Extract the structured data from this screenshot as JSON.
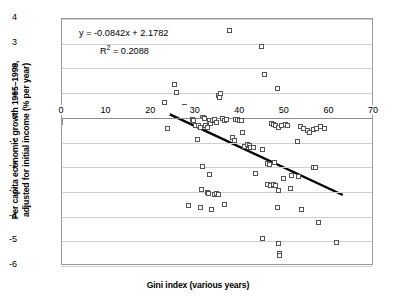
{
  "chart_data": {
    "type": "scatter",
    "title": "",
    "xlabel": "Gini index (various years)",
    "ylabel_line1": "Per capita economic growth 1965–1998,",
    "ylabel_line2": "adjusted for initial income (% per year)",
    "xlim": [
      0,
      70
    ],
    "ylim": [
      -6,
      4
    ],
    "xticks": [
      0,
      10,
      20,
      30,
      40,
      50,
      60,
      70
    ],
    "yticks": [
      4,
      3,
      2,
      1,
      0,
      -1,
      -2,
      -3,
      -4,
      -5,
      -6
    ],
    "grid": true,
    "legend": "none",
    "marker": "open-square",
    "marker_color": "#555555",
    "trendline": {
      "equation": "y = -0.0842x + 2.1782",
      "r2_label": "R",
      "r2_exp": "2",
      "r2_value": "= 0.2088",
      "slope": -0.0842,
      "intercept": 2.1782,
      "r_squared": 0.2088,
      "x_start": 23.0,
      "x_end": 63.0,
      "color": "#000000"
    },
    "points": [
      [
        23.0,
        0.62
      ],
      [
        23.3,
        0.4
      ],
      [
        23.6,
        -0.45
      ],
      [
        25.3,
        1.35
      ],
      [
        25.6,
        1.02
      ],
      [
        26.4,
        0.3
      ],
      [
        26.8,
        0.35
      ],
      [
        27.4,
        0.46
      ],
      [
        27.6,
        0.42
      ],
      [
        28.6,
        0.2
      ],
      [
        29.2,
        -0.06
      ],
      [
        29.6,
        -0.12
      ],
      [
        29.9,
        -0.3
      ],
      [
        30.4,
        -0.86
      ],
      [
        30.6,
        -0.3
      ],
      [
        31.0,
        -0.38
      ],
      [
        31.6,
        0.1
      ],
      [
        31.8,
        0.18
      ],
      [
        32.0,
        -0.02
      ],
      [
        32.3,
        -0.32
      ],
      [
        32.6,
        -0.4
      ],
      [
        33.0,
        -0.1
      ],
      [
        33.4,
        -0.22
      ],
      [
        33.8,
        -0.12
      ],
      [
        34.2,
        -0.06
      ],
      [
        34.6,
        -0.18
      ],
      [
        35.0,
        0.9
      ],
      [
        35.3,
        0.84
      ],
      [
        35.6,
        1.0
      ],
      [
        36.0,
        -0.02
      ],
      [
        36.4,
        -0.1
      ],
      [
        37.0,
        -0.05
      ],
      [
        37.6,
        3.55
      ],
      [
        38.2,
        -0.8
      ],
      [
        38.6,
        -0.92
      ],
      [
        39.0,
        -0.08
      ],
      [
        39.4,
        -0.06
      ],
      [
        39.8,
        -0.1
      ],
      [
        40.2,
        -0.12
      ],
      [
        40.6,
        -0.58
      ],
      [
        41.0,
        -1.16
      ],
      [
        41.6,
        -1.1
      ],
      [
        42.0,
        -1.14
      ],
      [
        42.4,
        -1.2
      ],
      [
        43.0,
        -1.2
      ],
      [
        44.8,
        2.89
      ],
      [
        45.4,
        1.74
      ],
      [
        45.0,
        -1.3
      ],
      [
        46.2,
        -1.86
      ],
      [
        46.6,
        -1.9
      ],
      [
        47.6,
        -1.82
      ],
      [
        48.4,
        1.2
      ],
      [
        47.0,
        -0.22
      ],
      [
        47.4,
        -0.28
      ],
      [
        48.0,
        -0.32
      ],
      [
        48.6,
        -0.4
      ],
      [
        49.2,
        -0.3
      ],
      [
        50.2,
        -0.26
      ],
      [
        50.6,
        -0.3
      ],
      [
        52.8,
        -0.94
      ],
      [
        53.6,
        -0.34
      ],
      [
        54.2,
        -0.42
      ],
      [
        55.0,
        -0.5
      ],
      [
        55.6,
        -0.58
      ],
      [
        56.4,
        -0.48
      ],
      [
        57.0,
        -0.42
      ],
      [
        58.0,
        -0.36
      ],
      [
        59.0,
        -0.44
      ],
      [
        31.6,
        -1.96
      ],
      [
        33.2,
        -2.3
      ],
      [
        31.2,
        -2.92
      ],
      [
        32.6,
        -3.02
      ],
      [
        32.8,
        -3.06
      ],
      [
        34.2,
        -3.1
      ],
      [
        34.6,
        -3.06
      ],
      [
        35.0,
        -3.12
      ],
      [
        28.4,
        -3.56
      ],
      [
        31.0,
        -3.64
      ],
      [
        33.6,
        -3.72
      ],
      [
        36.4,
        -3.5
      ],
      [
        43.4,
        -2.26
      ],
      [
        46.0,
        -2.72
      ],
      [
        46.8,
        -2.76
      ],
      [
        47.4,
        -2.7
      ],
      [
        48.0,
        -2.74
      ],
      [
        48.6,
        -2.94
      ],
      [
        49.8,
        -2.44
      ],
      [
        51.2,
        -2.86
      ],
      [
        51.6,
        -2.32
      ],
      [
        53.0,
        -2.36
      ],
      [
        56.4,
        -2.02
      ],
      [
        56.8,
        -2.0
      ],
      [
        48.4,
        -3.64
      ],
      [
        53.8,
        -3.72
      ],
      [
        45.0,
        -4.9
      ],
      [
        48.6,
        -5.1
      ],
      [
        48.8,
        -5.5
      ],
      [
        48.9,
        -5.58
      ],
      [
        57.6,
        -4.22
      ],
      [
        61.6,
        -5.04
      ]
    ]
  }
}
